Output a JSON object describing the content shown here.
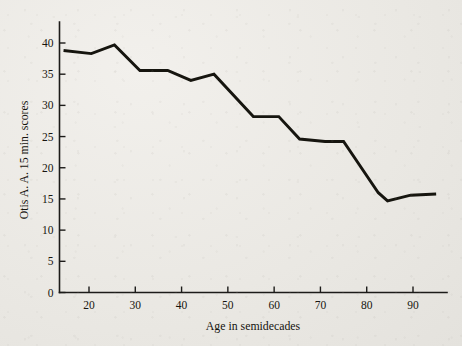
{
  "chart_data": {
    "type": "line",
    "title": "",
    "xlabel": "Age in semidecades",
    "ylabel": "Otis A. A. 15 min. scores",
    "xlim": [
      14,
      95
    ],
    "ylim": [
      0,
      42
    ],
    "grid": false,
    "legend": "none",
    "xticks": [
      20,
      30,
      40,
      50,
      60,
      70,
      80,
      90
    ],
    "xtick_labels": [
      "20",
      "30",
      "40",
      "50",
      "60",
      "70",
      "80",
      "90"
    ],
    "yticks": [
      0,
      5,
      10,
      15,
      20,
      25,
      30,
      35,
      40
    ],
    "ytick_labels": [
      "0",
      "5",
      "10",
      "15",
      "20",
      "25",
      "30",
      "35",
      "40"
    ],
    "series": [
      {
        "name": "Otis A. A. 15 min. scores by age",
        "color": "#16150f",
        "x": [
          14.5,
          20.5,
          25.5,
          31.0,
          37.0,
          42.0,
          47.0,
          55.5,
          61.0,
          65.5,
          71.0,
          75.0,
          82.5,
          84.5,
          89.5,
          95.0
        ],
        "y": [
          38.8,
          38.3,
          39.7,
          35.6,
          35.6,
          34.0,
          35.0,
          28.2,
          28.2,
          24.6,
          24.2,
          24.2,
          16.0,
          14.7,
          15.6,
          15.8
        ]
      }
    ]
  },
  "figure": {
    "background_color": "#eceae6",
    "axis_color": "#1c1b19",
    "line_color": "#16150f"
  }
}
